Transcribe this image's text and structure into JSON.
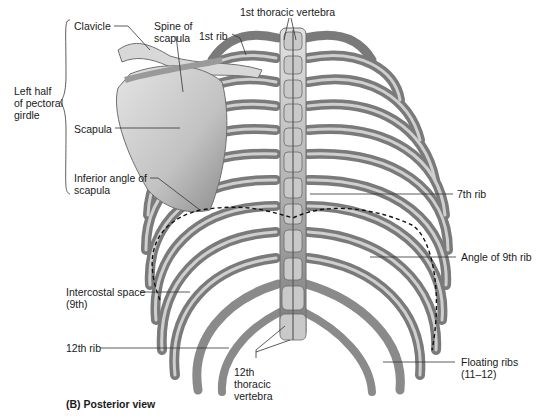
{
  "figure": {
    "caption": "(B)  Posterior view",
    "colors": {
      "background": "#ffffff",
      "bone_light": "#d6d6d6",
      "bone_mid": "#a9a9a9",
      "bone_shadow": "#6f6f6f",
      "leader_line": "#333333",
      "dashed_line": "#111111",
      "text": "#1a1a1a"
    }
  },
  "labels": {
    "clavicle": "Clavicle",
    "spine_of_scapula": "Spine of\nscapula",
    "first_rib": "1st rib",
    "first_thoracic_vertebra": "1st thoracic vertebra",
    "left_half_pectoral_girdle": "Left half\nof pectoral\ngirdle",
    "scapula": "Scapula",
    "inferior_angle_scapula": "Inferior angle of\nscapula",
    "seventh_rib": "7th rib",
    "angle_of_9th_rib": "Angle of 9th rib",
    "intercostal_space": "Intercostal space\n(9th)",
    "twelfth_rib": "12th rib",
    "twelfth_thoracic_vertebra": "12th\nthoracic\nvertebra",
    "floating_ribs": "Floating ribs\n(11–12)"
  }
}
